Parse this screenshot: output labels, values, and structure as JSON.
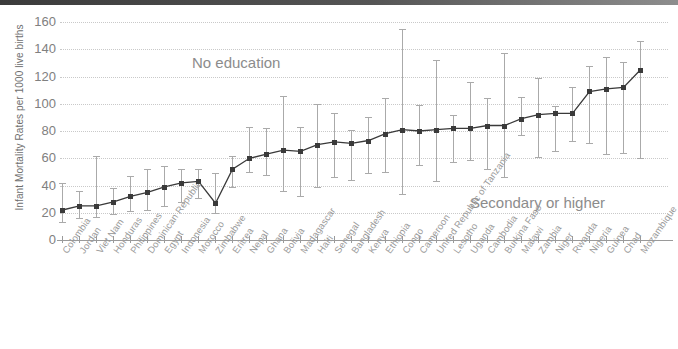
{
  "topbar": {
    "present": true,
    "color": "#3b3b3b"
  },
  "chart_data": {
    "type": "line",
    "title": "",
    "xlabel": "",
    "ylabel": "Infant Mortality Rates per 1000 live births",
    "ylim": [
      0,
      160
    ],
    "yticks": [
      0,
      20,
      40,
      60,
      80,
      100,
      120,
      140,
      160
    ],
    "grid": true,
    "legend_position": "none",
    "annotations": [
      {
        "text": "No education",
        "x_frac": 0.22,
        "y_value": 137
      },
      {
        "text": "Secondary or higher",
        "x_frac": 0.68,
        "y_value": 33
      }
    ],
    "categories": [
      "Colombia",
      "Jordan",
      "Viet Nam",
      "Honduras",
      "Philippines",
      "Dominican Republic",
      "Egypt",
      "Indonesia",
      "Morocco",
      "Zimbabwe",
      "Eritrea",
      "Nepal",
      "Ghana",
      "Bolivia",
      "Madagascar",
      "Haiti",
      "Senegal",
      "Bangladesh",
      "Kenya",
      "Ethiopia",
      "Congo",
      "Cameroon",
      "United Republic of Tanzania",
      "Lesotho",
      "Uganda",
      "Cambodia",
      "Burkina Faso",
      "Malawi",
      "Zambia",
      "Niger",
      "Rwanda",
      "Nigeria",
      "Guinea",
      "Chad",
      "Mozambique"
    ],
    "series": [
      {
        "name": "Infant mortality rate",
        "values": [
          22,
          25,
          25,
          28,
          32,
          35,
          39,
          42,
          43,
          27,
          52,
          60,
          63,
          66,
          65,
          70,
          72,
          71,
          73,
          78,
          81,
          80,
          81,
          82,
          82,
          84,
          84,
          89,
          92,
          93,
          93,
          109,
          111,
          112,
          125
        ],
        "error_low": [
          13,
          16,
          17,
          19,
          21,
          22,
          25,
          28,
          31,
          20,
          39,
          50,
          48,
          36,
          32,
          39,
          46,
          44,
          49,
          50,
          34,
          55,
          43,
          57,
          59,
          52,
          46,
          77,
          61,
          65,
          73,
          71,
          63,
          64,
          60
        ],
        "error_high": [
          42,
          36,
          62,
          38,
          47,
          52,
          54,
          52,
          52,
          49,
          62,
          83,
          82,
          106,
          83,
          100,
          93,
          81,
          90,
          104,
          155,
          99,
          132,
          92,
          116,
          104,
          137,
          105,
          119,
          98,
          112,
          128,
          134,
          131,
          146
        ]
      }
    ]
  }
}
